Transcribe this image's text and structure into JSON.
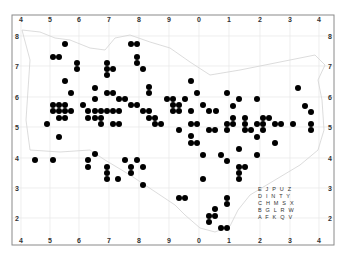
{
  "map": {
    "type": "distribution-map",
    "frame": {
      "left": 12,
      "top": 15,
      "right": 334,
      "bottom": 245
    },
    "colors": {
      "frame": "#8a8a8a",
      "grid": "#e6e6e6",
      "outline": "#d0d0d0",
      "dot": "#000000",
      "background": "#ffffff"
    },
    "x_ticks": [
      {
        "label": "4",
        "x": 21
      },
      {
        "label": "5",
        "x": 50
      },
      {
        "label": "6",
        "x": 79
      },
      {
        "label": "7",
        "x": 109
      },
      {
        "label": "8",
        "x": 139
      },
      {
        "label": "9",
        "x": 169
      },
      {
        "label": "0",
        "x": 199
      },
      {
        "label": "1",
        "x": 229
      },
      {
        "label": "2",
        "x": 260
      },
      {
        "label": "3",
        "x": 290
      },
      {
        "label": "4",
        "x": 319
      }
    ],
    "y_ticks": [
      {
        "label": "8",
        "y": 36
      },
      {
        "label": "7",
        "y": 66
      },
      {
        "label": "6",
        "y": 97
      },
      {
        "label": "5",
        "y": 127
      },
      {
        "label": "4",
        "y": 158
      },
      {
        "label": "3",
        "y": 188
      },
      {
        "label": "2",
        "y": 218
      }
    ],
    "legend_grid": {
      "rows": [
        "E J P U Z",
        "D I N T Y",
        "C H M S X",
        "B G L R W",
        "A F K Q V"
      ]
    },
    "dots": [
      [
        65,
        44
      ],
      [
        131,
        44
      ],
      [
        137,
        44
      ],
      [
        53,
        57
      ],
      [
        59,
        57
      ],
      [
        137,
        57
      ],
      [
        77,
        63
      ],
      [
        107,
        63
      ],
      [
        137,
        63
      ],
      [
        77,
        69
      ],
      [
        107,
        69
      ],
      [
        113,
        69
      ],
      [
        143,
        69
      ],
      [
        107,
        75
      ],
      [
        65,
        81
      ],
      [
        191,
        81
      ],
      [
        95,
        88
      ],
      [
        298,
        88
      ],
      [
        71,
        93
      ],
      [
        107,
        93
      ],
      [
        113,
        93
      ],
      [
        149,
        87
      ],
      [
        149,
        93
      ],
      [
        197,
        93
      ],
      [
        227,
        93
      ],
      [
        95,
        99
      ],
      [
        119,
        99
      ],
      [
        125,
        99
      ],
      [
        167,
        99
      ],
      [
        173,
        99
      ],
      [
        185,
        99
      ],
      [
        239,
        99
      ],
      [
        257,
        99
      ],
      [
        53,
        105
      ],
      [
        59,
        105
      ],
      [
        65,
        105
      ],
      [
        83,
        105
      ],
      [
        131,
        105
      ],
      [
        137,
        105
      ],
      [
        173,
        105
      ],
      [
        179,
        105
      ],
      [
        203,
        105
      ],
      [
        233,
        106
      ],
      [
        305,
        106
      ],
      [
        53,
        111
      ],
      [
        59,
        111
      ],
      [
        65,
        111
      ],
      [
        71,
        111
      ],
      [
        88,
        111
      ],
      [
        95,
        111
      ],
      [
        101,
        111
      ],
      [
        107,
        111
      ],
      [
        113,
        111
      ],
      [
        119,
        111
      ],
      [
        143,
        111
      ],
      [
        149,
        111
      ],
      [
        173,
        111
      ],
      [
        179,
        111
      ],
      [
        191,
        111
      ],
      [
        209,
        111
      ],
      [
        216,
        111
      ],
      [
        311,
        112
      ],
      [
        59,
        118
      ],
      [
        65,
        118
      ],
      [
        88,
        118
      ],
      [
        95,
        118
      ],
      [
        101,
        118
      ],
      [
        149,
        118
      ],
      [
        155,
        118
      ],
      [
        233,
        118
      ],
      [
        245,
        118
      ],
      [
        263,
        118
      ],
      [
        269,
        118
      ],
      [
        47,
        124
      ],
      [
        101,
        124
      ],
      [
        113,
        124
      ],
      [
        119,
        124
      ],
      [
        155,
        124
      ],
      [
        161,
        124
      ],
      [
        191,
        124
      ],
      [
        197,
        124
      ],
      [
        227,
        124
      ],
      [
        233,
        124
      ],
      [
        245,
        124
      ],
      [
        257,
        124
      ],
      [
        263,
        124
      ],
      [
        275,
        124
      ],
      [
        281,
        124
      ],
      [
        293,
        124
      ],
      [
        311,
        124
      ],
      [
        179,
        130
      ],
      [
        209,
        130
      ],
      [
        215,
        130
      ],
      [
        227,
        130
      ],
      [
        245,
        130
      ],
      [
        251,
        130
      ],
      [
        263,
        130
      ],
      [
        311,
        130
      ],
      [
        59,
        137
      ],
      [
        191,
        136
      ],
      [
        257,
        137
      ],
      [
        191,
        143
      ],
      [
        197,
        143
      ],
      [
        275,
        143
      ],
      [
        239,
        149
      ],
      [
        95,
        154
      ],
      [
        35,
        160
      ],
      [
        53,
        160
      ],
      [
        88,
        160
      ],
      [
        125,
        160
      ],
      [
        137,
        160
      ],
      [
        203,
        155
      ],
      [
        221,
        155
      ],
      [
        257,
        155
      ],
      [
        227,
        161
      ],
      [
        88,
        167
      ],
      [
        107,
        167
      ],
      [
        131,
        167
      ],
      [
        143,
        167
      ],
      [
        239,
        167
      ],
      [
        245,
        167
      ],
      [
        107,
        173
      ],
      [
        131,
        173
      ],
      [
        239,
        173
      ],
      [
        107,
        179
      ],
      [
        118,
        179
      ],
      [
        203,
        179
      ],
      [
        239,
        179
      ],
      [
        143,
        185
      ],
      [
        179,
        198
      ],
      [
        185,
        198
      ],
      [
        227,
        198
      ],
      [
        227,
        204
      ],
      [
        215,
        209
      ],
      [
        209,
        216
      ],
      [
        215,
        216
      ],
      [
        209,
        222
      ],
      [
        221,
        228
      ],
      [
        227,
        228
      ]
    ]
  }
}
